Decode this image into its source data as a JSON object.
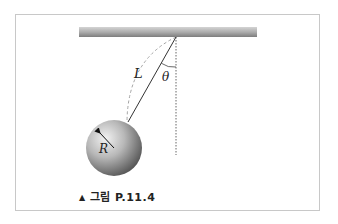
{
  "figure": {
    "caption_marker": "▲",
    "caption_text": "그림 P.11.4",
    "labels": {
      "length": "L",
      "angle": "θ",
      "radius": "R"
    },
    "colors": {
      "frame_border": "#c8c8c8",
      "ceiling_light": "#d9d9d9",
      "ceiling_dark": "#8a8a8a",
      "string": "#333333",
      "dashed_arc": "#999999",
      "dotted_vertical": "#555555",
      "ball_highlight": "#eeeeee",
      "ball_shadow": "#555555"
    }
  }
}
